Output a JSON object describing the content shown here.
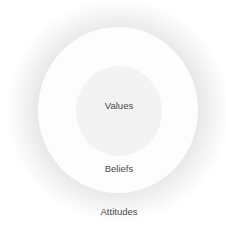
{
  "diagram": {
    "type": "concentric-circles",
    "layers": [
      {
        "name": "values",
        "label": "Values",
        "position": "inner"
      },
      {
        "name": "beliefs",
        "label": "Beliefs",
        "position": "middle"
      },
      {
        "name": "attitudes",
        "label": "Attitudes",
        "position": "outer"
      }
    ],
    "colors": {
      "outer_halo": "#dcdcdc",
      "middle_ring": "#fdfdfd",
      "inner_core": "#f3f3f3",
      "text": "#4a4a4a"
    }
  }
}
